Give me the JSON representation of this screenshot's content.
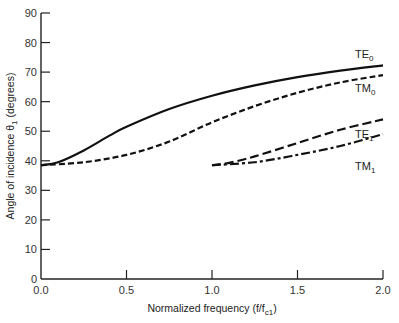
{
  "chart_data": {
    "type": "line",
    "title": "",
    "xlabel": "Normalized frequency (f/f",
    "xlabel_sub": "c1",
    "xlabel_tail": ")",
    "ylabel": "Angle of incidence θ",
    "ylabel_sub": "1",
    "ylabel_tail": " (degrees)",
    "xlim": [
      0.0,
      2.0
    ],
    "ylim": [
      0,
      90
    ],
    "x_ticks": [
      "0.0",
      "0.5",
      "1.0",
      "1.5",
      "2.0"
    ],
    "y_ticks": [
      "0",
      "10",
      "20",
      "30",
      "40",
      "50",
      "60",
      "70",
      "80",
      "90"
    ],
    "grid": false,
    "legend": "inline labels at right end of curves",
    "series": [
      {
        "name": "TE0",
        "base": "TE",
        "sub": "0",
        "style": "solid",
        "x": [
          0.0,
          0.1,
          0.25,
          0.4,
          0.5,
          0.75,
          1.0,
          1.25,
          1.5,
          1.75,
          2.0
        ],
        "values": [
          38.5,
          39.5,
          43.5,
          48.5,
          51.5,
          57.5,
          62,
          65.5,
          68.3,
          70.5,
          72.3
        ]
      },
      {
        "name": "TM0",
        "base": "TM",
        "sub": "0",
        "style": "dashed",
        "x": [
          0.0,
          0.25,
          0.5,
          0.75,
          1.0,
          1.25,
          1.5,
          1.75,
          2.0
        ],
        "values": [
          38.5,
          39.5,
          42,
          46.5,
          53,
          58.5,
          63,
          66.5,
          69
        ]
      },
      {
        "name": "TE1",
        "base": "TE",
        "sub": "1",
        "style": "long-dash",
        "x": [
          1.0,
          1.1,
          1.25,
          1.5,
          1.75,
          2.0
        ],
        "values": [
          38.5,
          39.3,
          41.5,
          46,
          50.5,
          54
        ]
      },
      {
        "name": "TM1",
        "base": "TM",
        "sub": "1",
        "style": "dash-dot",
        "x": [
          1.0,
          1.25,
          1.5,
          1.75,
          2.0
        ],
        "values": [
          38.5,
          39.5,
          42,
          45,
          49
        ]
      }
    ]
  },
  "colors": {
    "line": "#111111",
    "axis": "#222222",
    "text": "#333333"
  }
}
